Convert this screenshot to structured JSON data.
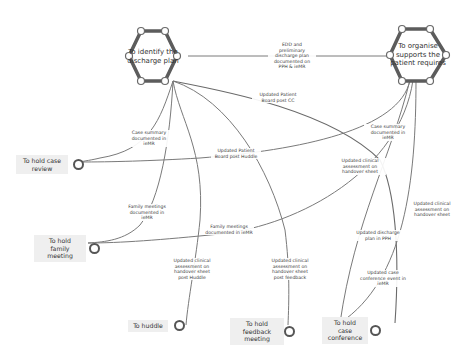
{
  "goals": [
    {
      "id": "identify",
      "label": "To identify the discharge plan",
      "ports": [
        "",
        "",
        "",
        "",
        "",
        ""
      ]
    },
    {
      "id": "organise",
      "label": "To organise supports the patient requires",
      "ports": [
        "",
        "",
        "",
        "",
        "",
        ""
      ]
    }
  ],
  "tasks": [
    {
      "id": "case-review",
      "label": "To hold case review"
    },
    {
      "id": "family-meeting",
      "label": "To hold family meeting"
    },
    {
      "id": "huddle",
      "label": "To huddle"
    },
    {
      "id": "feedback-meeting",
      "label": "To hold feedback meeting"
    },
    {
      "id": "case-conference",
      "label": "To hold case conference"
    }
  ],
  "edge_labels": {
    "edd": "EDD and preliminary discharge plan documented on PPH & ieMR",
    "pb_cc": "Updated Patient Board post CC",
    "case_summary_left": "Case summary documented in ieMR",
    "case_summary_right": "Case summary documented in ieMR",
    "pb_huddle": "Updated Patient Board post Huddle",
    "clinical_handover": "Updated clinical assessment on handover sheet",
    "family_left": "Family meetings documented in ieMR",
    "family_mid": "Family meetings documented in ieMR",
    "clinical_handover_right": "Updated clinical assessment on handover sheet",
    "discharge_pph": "Updated discharge plan in PPH",
    "clinical_huddle": "Updated clinical assessment on handover sheet post Huddle",
    "clinical_feedback": "Updated clinical assessment on handover sheet post feedback",
    "case_conference_event": "Updated case conference event in ieMR"
  },
  "colors": {
    "hex_stroke": "#5c5c5c",
    "edge": "#7a7a7a",
    "task_bg": "#efefef",
    "background": "#ffffff"
  }
}
